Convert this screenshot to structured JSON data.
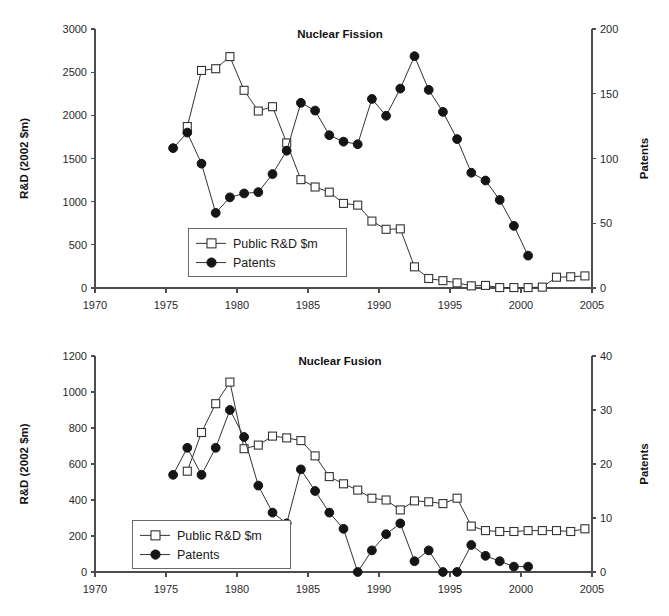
{
  "page": {
    "background": "#ffffff",
    "width": 669,
    "height": 616
  },
  "colors": {
    "axis": "#4d4d4d",
    "line": "#333333",
    "patents_marker": "#151515",
    "rd_marker_fill": "#ffffff",
    "text": "#1a1a1a"
  },
  "legend": {
    "rd_label": "Public R&D $m",
    "patents_label": "Patents"
  },
  "fission": {
    "title": "Nuclear Fission",
    "ylabel_left": "R&D (2002 $m)",
    "ylabel_right": "Patents",
    "xticks": [
      "1970",
      "1975",
      "1980",
      "1985",
      "1990",
      "1995",
      "2000",
      "2005"
    ],
    "yticks_left": [
      "0",
      "500",
      "1000",
      "1500",
      "2000",
      "2500",
      "3000"
    ],
    "yticks_right": [
      "0",
      "50",
      "100",
      "150",
      "200"
    ]
  },
  "fusion": {
    "title": "Nuclear Fusion",
    "ylabel_left": "R&D (2002 $m)",
    "ylabel_right": "Patents",
    "xticks": [
      "1970",
      "1975",
      "1980",
      "1985",
      "1990",
      "1995",
      "2000",
      "2005"
    ],
    "yticks_left": [
      "0",
      "200",
      "400",
      "600",
      "800",
      "1000",
      "1200"
    ],
    "yticks_right": [
      "0",
      "10",
      "20",
      "30",
      "40"
    ]
  },
  "chart_data": [
    {
      "type": "line",
      "title": "Nuclear Fission",
      "xlabel": "",
      "ylabel": "R&D (2002 $m)",
      "ylabel_right": "Patents",
      "xlim": [
        1970,
        2005
      ],
      "ylim": [
        0,
        3000
      ],
      "ylim_right": [
        0,
        200
      ],
      "grid": false,
      "legend_position": "center-left",
      "x": [
        1975.5,
        1976.5,
        1977.5,
        1978.5,
        1979.5,
        1980.5,
        1981.5,
        1982.5,
        1983.5,
        1984.5,
        1985.5,
        1986.5,
        1987.5,
        1988.5,
        1989.5,
        1990.5,
        1991.5,
        1992.5,
        1993.5,
        1994.5,
        1995.5,
        1996.5,
        1997.5,
        1998.5,
        1999.5,
        2000.5,
        2001.5,
        2002.5,
        2003.5,
        2004.5
      ],
      "series": [
        {
          "name": "Public R&D $m",
          "axis": "left",
          "marker": "open-square",
          "x": [
            1976.5,
            1977.5,
            1978.5,
            1979.5,
            1980.5,
            1981.5,
            1982.5,
            1983.5,
            1984.5,
            1985.5,
            1986.5,
            1987.5,
            1988.5,
            1989.5,
            1990.5,
            1991.5,
            1992.5,
            1993.5,
            1994.5,
            1995.5,
            1996.5,
            1997.5,
            1998.5,
            1999.5,
            2000.5,
            2001.5,
            2002.5,
            2003.5,
            2004.5
          ],
          "values": [
            1870,
            2520,
            2540,
            2680,
            2290,
            2050,
            2100,
            1680,
            1255,
            1170,
            1110,
            980,
            960,
            775,
            680,
            685,
            245,
            110,
            85,
            60,
            25,
            30,
            5,
            5,
            5,
            10,
            125,
            130,
            140
          ]
        },
        {
          "name": "Patents",
          "axis": "right",
          "marker": "filled-circle",
          "x": [
            1975.5,
            1976.5,
            1977.5,
            1978.5,
            1979.5,
            1980.5,
            1981.5,
            1982.5,
            1983.5,
            1984.5,
            1985.5,
            1986.5,
            1987.5,
            1988.5,
            1989.5,
            1990.5,
            1991.5,
            1992.5,
            1993.5,
            1994.5,
            1995.5,
            1996.5,
            1997.5,
            1998.5,
            1999.5,
            2000.5
          ],
          "values": [
            108,
            120,
            96,
            58,
            70,
            73,
            74,
            88,
            106,
            143,
            137,
            118,
            113,
            111,
            146,
            133,
            154,
            179,
            153,
            136,
            115,
            89,
            83,
            68,
            48,
            25
          ]
        }
      ]
    },
    {
      "type": "line",
      "title": "Nuclear Fusion",
      "xlabel": "",
      "ylabel": "R&D (2002 $m)",
      "ylabel_right": "Patents",
      "xlim": [
        1970,
        2005
      ],
      "ylim": [
        0,
        1200
      ],
      "ylim_right": [
        0,
        40
      ],
      "grid": false,
      "legend_position": "center-left",
      "series": [
        {
          "name": "Public R&D $m",
          "axis": "left",
          "marker": "open-square",
          "x": [
            1976.5,
            1977.5,
            1978.5,
            1979.5,
            1980.5,
            1981.5,
            1982.5,
            1983.5,
            1984.5,
            1985.5,
            1986.5,
            1987.5,
            1988.5,
            1989.5,
            1990.5,
            1991.5,
            1992.5,
            1993.5,
            1994.5,
            1995.5,
            1996.5,
            1997.5,
            1998.5,
            1999.5,
            2000.5,
            2001.5,
            2002.5,
            2003.5,
            2004.5
          ],
          "values": [
            560,
            775,
            935,
            1055,
            685,
            705,
            755,
            745,
            730,
            645,
            530,
            490,
            455,
            410,
            400,
            345,
            395,
            390,
            380,
            410,
            255,
            230,
            225,
            225,
            230,
            230,
            230,
            225,
            240
          ]
        },
        {
          "name": "Patents",
          "axis": "right",
          "marker": "filled-circle",
          "x": [
            1975.5,
            1976.5,
            1977.5,
            1978.5,
            1979.5,
            1980.5,
            1981.5,
            1982.5,
            1983.5,
            1984.5,
            1985.5,
            1986.5,
            1987.5,
            1988.5,
            1989.5,
            1990.5,
            1991.5,
            1992.5,
            1993.5,
            1994.5,
            1995.5,
            1996.5,
            1997.5,
            1998.5,
            1999.5,
            2000.5
          ],
          "values": [
            18,
            23,
            18,
            23,
            30,
            25,
            16,
            11,
            9,
            19,
            15,
            11,
            8,
            0,
            4,
            7,
            9,
            2,
            4,
            0,
            0,
            5,
            3,
            2,
            1,
            1
          ]
        }
      ]
    }
  ]
}
